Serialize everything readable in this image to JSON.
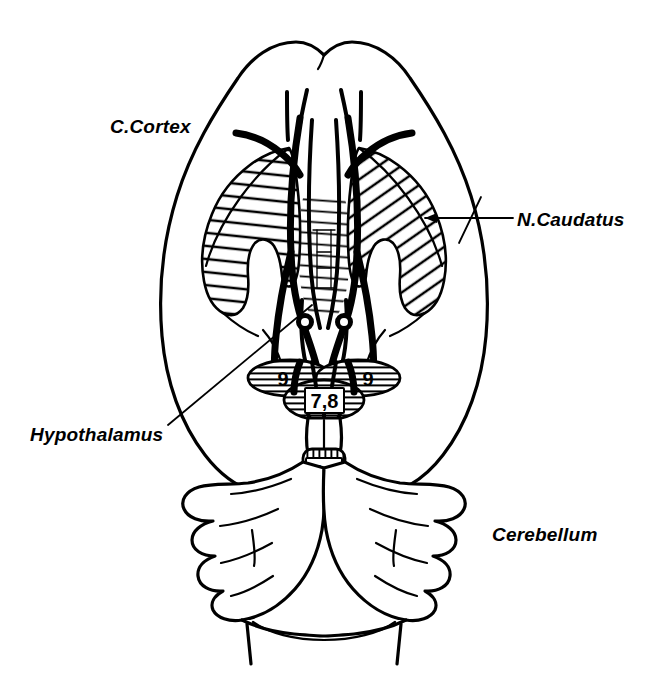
{
  "figure": {
    "kind": "anatomical-diagram",
    "background_color": "#ffffff",
    "ink_color": "#000000"
  },
  "labels": {
    "cortex": "C.Cortex",
    "caudatus": "N.Caudatus",
    "hypothalamus": "Hypothalamus",
    "cerebellum": "Cerebellum"
  },
  "regions": [
    {
      "id": "region-left-9",
      "text": "9",
      "structure": "lateral oval, left",
      "hatch": "horizontal"
    },
    {
      "id": "region-right-9",
      "text": "9",
      "structure": "lateral oval, right",
      "hatch": "horizontal"
    },
    {
      "id": "region-78",
      "text": "7,8",
      "structure": "central midline band",
      "hatch": "horizontal"
    },
    {
      "id": "region-56",
      "text": "5,6",
      "structure": "brainstem rounded square",
      "hatch": "vertical"
    }
  ],
  "leaders": [
    {
      "id": "leader-caudatus",
      "from": "N.Caudatus label",
      "to": "right caudate nucleus",
      "arrow": true
    },
    {
      "id": "leader-hypothalamus",
      "from": "Hypothalamus label",
      "to": "midline hypothalamic area",
      "arrow": false
    }
  ]
}
